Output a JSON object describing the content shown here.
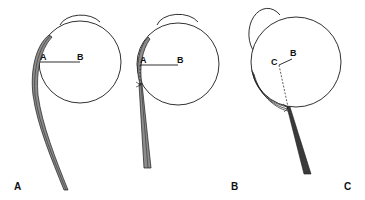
{
  "figure": {
    "panels": [
      {
        "id": "A",
        "panel_label": "A",
        "points": [
          {
            "label": "A"
          },
          {
            "label": "B"
          }
        ],
        "description": "Eyeball with muscle wrapping around the globe; lever arm A–B"
      },
      {
        "id": "B",
        "panel_label": "B",
        "points": [
          {
            "label": "A"
          },
          {
            "label": "B"
          }
        ],
        "description": "Eyeball with muscle tangent point; lever arm A–B with dashed perpendicular to insertion"
      },
      {
        "id": "C",
        "panel_label": "C",
        "points": [
          {
            "label": "C"
          },
          {
            "label": "B"
          }
        ],
        "description": "Rotated eyeball; short lever C–B with dashed line to muscle contact point"
      }
    ],
    "colors": {
      "outline": "#1a1a1a",
      "muscle_fill": "#8c8c8c",
      "background": "#ffffff"
    }
  }
}
